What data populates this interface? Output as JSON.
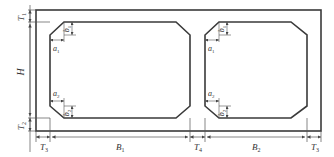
{
  "diagram": {
    "colors": {
      "line": "#3a3a3a",
      "dim_line": "#555555",
      "text": "#333333",
      "background": "#ffffff"
    },
    "labels": {
      "T1_top": {
        "main": "T",
        "sub": "1"
      },
      "H": {
        "main": "H",
        "sub": ""
      },
      "T2": {
        "main": "T",
        "sub": "2"
      },
      "T3_left": {
        "main": "T",
        "sub": "3"
      },
      "B1": {
        "main": "B",
        "sub": "1"
      },
      "T4": {
        "main": "T",
        "sub": "4"
      },
      "B2": {
        "main": "B",
        "sub": "2"
      },
      "T3_right": {
        "main": "T",
        "sub": "3"
      },
      "cell1_a1": {
        "main": "a",
        "sub": "1"
      },
      "cell1_b1": {
        "main": "b",
        "sub": "1"
      },
      "cell1_a2": {
        "main": "a",
        "sub": "2"
      },
      "cell1_b2": {
        "main": "b",
        "sub": "2"
      },
      "cell2_a1": {
        "main": "a",
        "sub": "1"
      },
      "cell2_b1": {
        "main": "b",
        "sub": "1"
      },
      "cell2_a2": {
        "main": "a",
        "sub": "2"
      },
      "cell2_b2": {
        "main": "b",
        "sub": "2"
      }
    }
  }
}
